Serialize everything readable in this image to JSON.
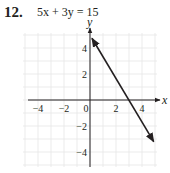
{
  "problem": {
    "number": "12.",
    "equation": "5x + 3y = 15"
  },
  "chart_data": {
    "type": "line",
    "title": "5x + 3y = 15",
    "xlabel": "x",
    "ylabel": "y",
    "xlim": [
      -5,
      5
    ],
    "ylim": [
      -5,
      5
    ],
    "grid": true,
    "x_ticks": [
      "-4",
      "-2",
      "0",
      "2",
      "4"
    ],
    "y_ticks": [
      "4",
      "2",
      "-2",
      "-4"
    ],
    "series": [
      {
        "name": "5x + 3y = 15",
        "x": [
          0,
          3
        ],
        "y": [
          5,
          0
        ],
        "slope": -1.6667,
        "y_intercept": 5,
        "x_intercept": 3,
        "arrows": "both",
        "drawn_from": [
          0.15,
          4.75
        ],
        "drawn_to": [
          4.9,
          -3.2
        ]
      }
    ]
  },
  "colors": {
    "ink": "#231f20",
    "grid": "#e6e6e6"
  }
}
